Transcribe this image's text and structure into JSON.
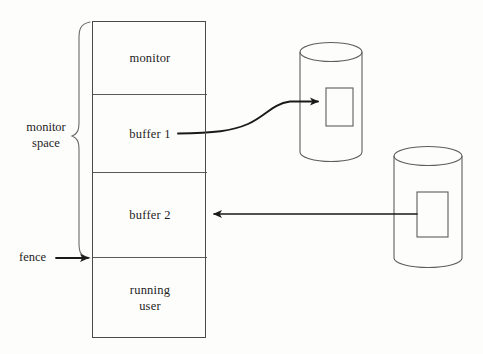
{
  "diagram": {
    "background_color": "#fdfdfc",
    "stroke_color": "#4a4a4a",
    "arrow_color": "#1a1a1a",
    "text_color": "#1d1d1d"
  },
  "memory_block": {
    "name": "main memory",
    "cells": [
      {
        "id": "monitor",
        "label": "monitor",
        "in_monitor_space": true
      },
      {
        "id": "buffer1",
        "label": "buffer 1",
        "in_monitor_space": true
      },
      {
        "id": "buffer2",
        "label": "buffer 2",
        "in_monitor_space": true
      },
      {
        "id": "running",
        "label": "running\nuser",
        "in_monitor_space": false
      }
    ]
  },
  "annotations": {
    "brace_label": "monitor\nspace",
    "fence_label": "fence"
  },
  "disks": [
    {
      "id": "disk-1",
      "label": "",
      "block_label": ""
    },
    {
      "id": "disk-2",
      "label": "",
      "block_label": ""
    }
  ],
  "arrows": [
    {
      "id": "buffer1-to-disk1",
      "from": "buffer 1",
      "to": "disk-1",
      "direction": "right",
      "style": "curved"
    },
    {
      "id": "disk2-to-buffer2",
      "from": "disk-2",
      "to": "buffer 2",
      "direction": "left",
      "style": "straight"
    },
    {
      "id": "fence-pointer",
      "from": "fence",
      "to": "memory boundary",
      "direction": "right",
      "style": "straight"
    }
  ],
  "icons": {
    "disk": "cylinder-icon",
    "brace": "curly-brace-icon",
    "arrow": "arrow-icon"
  }
}
